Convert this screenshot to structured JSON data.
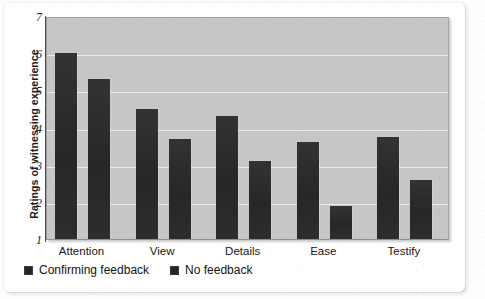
{
  "chart_data": {
    "type": "bar",
    "title": "",
    "subtitle": "",
    "xlabel": "",
    "ylabel": "Ratings of witnessing experience",
    "categories": [
      "Attention",
      "View",
      "Details",
      "Ease",
      "Testify"
    ],
    "series": [
      {
        "name": "Confirming feedback",
        "color": "#262626",
        "values": [
          6.0,
          4.5,
          4.3,
          3.6,
          3.75
        ]
      },
      {
        "name": "No feedback",
        "color": "#262626",
        "values": [
          5.3,
          3.7,
          3.1,
          1.9,
          2.6
        ]
      }
    ],
    "ylim": [
      1,
      7
    ],
    "ytick_labels": [
      "1",
      "2",
      "3",
      "4",
      "5",
      "6",
      "7"
    ],
    "ytick_values": [
      1,
      2,
      3,
      4,
      5,
      6,
      7
    ],
    "grid": true,
    "grid_axis": "y",
    "legend_position": "bottom-left",
    "plot_background_color": "#c6c6c6",
    "gridline_color": "#eceaea",
    "page_background_color": "#ffffff"
  },
  "legend": {
    "items": [
      {
        "label": "Confirming feedback",
        "swatch_icon": "filled-square-icon"
      },
      {
        "label": "No feedback",
        "swatch_icon": "filled-square-icon"
      }
    ]
  }
}
